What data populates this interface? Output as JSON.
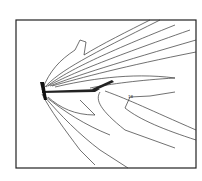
{
  "figure": {
    "frame": {
      "x": 16,
      "y": 20,
      "width": 180,
      "height": 148
    },
    "labels": [
      "18",
      "1.0",
      "0.9"
    ],
    "colors": {
      "line": "#222222",
      "background": "#ffffff"
    }
  }
}
